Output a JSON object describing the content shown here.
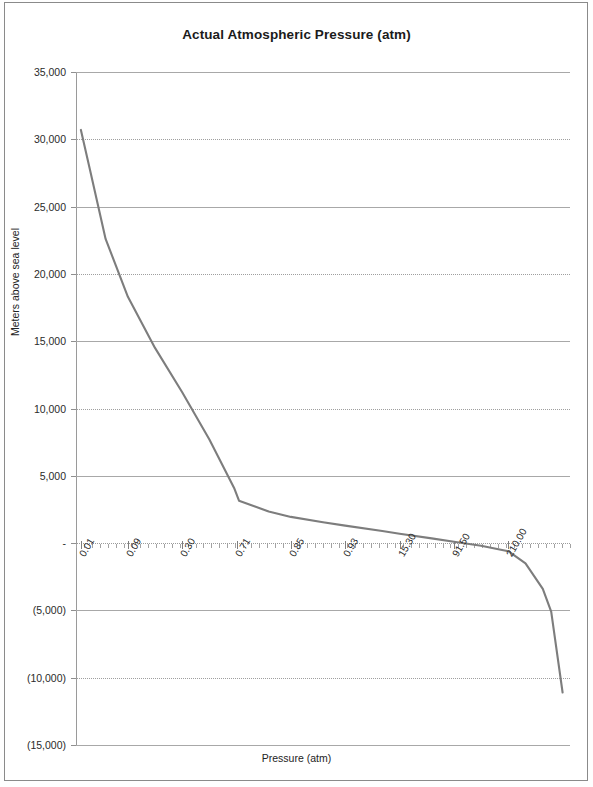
{
  "document": {
    "kind": "scanned-chart-page",
    "background_color": "#ffffff",
    "frame_color": "#8a8a8a"
  },
  "chart_data": {
    "type": "line",
    "title": "Actual Atmospheric Pressure (atm)",
    "xlabel": "Pressure (atm)",
    "ylabel": "Meters above sea level",
    "grid": true,
    "legend": "none",
    "line_color": "#7d7d7d",
    "ylim": [
      -15000,
      35000
    ],
    "ytick_values": [
      35000,
      30000,
      25000,
      20000,
      15000,
      10000,
      5000,
      0,
      -5000,
      -10000,
      -15000
    ],
    "ytick_labels": [
      "35,000",
      "30,000",
      "25,000",
      "20,000",
      "15,000",
      "10,000",
      "5,000",
      "-",
      "(5,000)",
      "(10,000)",
      "(15,000)"
    ],
    "xtick_labels": [
      "0.01",
      "0.09",
      "0.30",
      "0.71",
      "0.85",
      "0.93",
      "15.30",
      "91.50",
      "210.00"
    ],
    "xtick_positions": [
      0.01,
      0.105,
      0.215,
      0.325,
      0.435,
      0.545,
      0.655,
      0.765,
      0.875
    ],
    "categories": [
      "0.01",
      "0.09",
      "0.30",
      "0.71",
      "0.85",
      "0.93",
      "15.30",
      "91.50",
      "210.00"
    ],
    "values": [
      30700,
      18500,
      9500,
      3200,
      2100,
      1400,
      500,
      -600,
      -1600
    ],
    "series": [
      {
        "name": "Actual Atmospheric Pressure",
        "points": [
          {
            "x": 0.01,
            "y": 30700
          },
          {
            "x": 0.028,
            "y": 27800
          },
          {
            "x": 0.06,
            "y": 22600
          },
          {
            "x": 0.105,
            "y": 18300
          },
          {
            "x": 0.16,
            "y": 14500
          },
          {
            "x": 0.215,
            "y": 11200
          },
          {
            "x": 0.27,
            "y": 7700
          },
          {
            "x": 0.32,
            "y": 4100
          },
          {
            "x": 0.33,
            "y": 3150
          },
          {
            "x": 0.39,
            "y": 2350
          },
          {
            "x": 0.435,
            "y": 1950
          },
          {
            "x": 0.5,
            "y": 1550
          },
          {
            "x": 0.545,
            "y": 1300
          },
          {
            "x": 0.62,
            "y": 900
          },
          {
            "x": 0.655,
            "y": 700
          },
          {
            "x": 0.72,
            "y": 350
          },
          {
            "x": 0.765,
            "y": 100
          },
          {
            "x": 0.82,
            "y": -200
          },
          {
            "x": 0.875,
            "y": -600
          },
          {
            "x": 0.91,
            "y": -1500
          },
          {
            "x": 0.945,
            "y": -3400
          },
          {
            "x": 0.962,
            "y": -5100
          },
          {
            "x": 0.985,
            "y": -11100
          }
        ]
      }
    ]
  }
}
